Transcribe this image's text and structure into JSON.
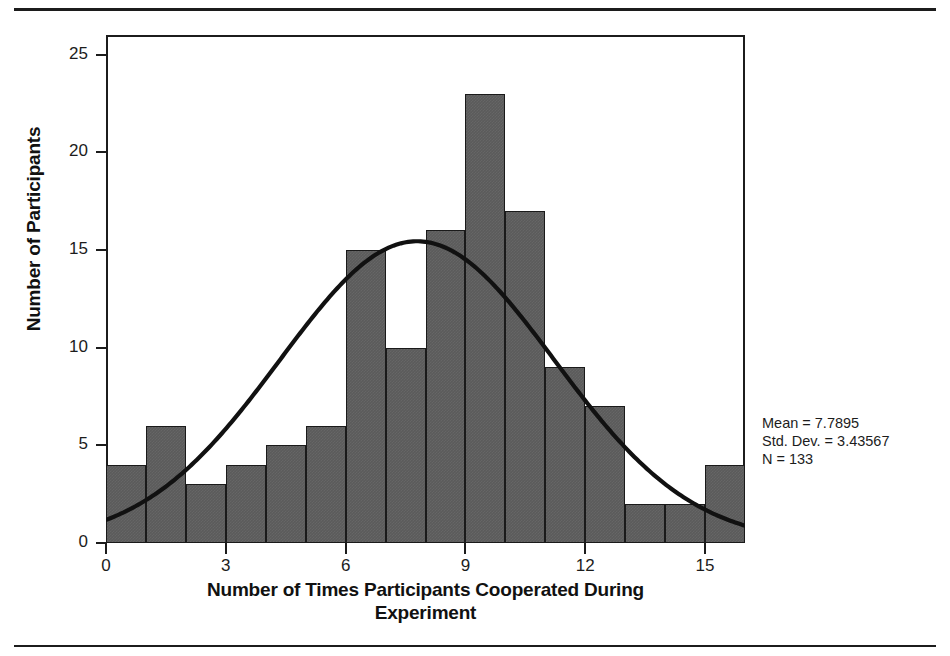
{
  "figure": {
    "kind": "histogram-with-normal-curve"
  },
  "rules": {
    "top": "horizontal-rule",
    "bottom": "horizontal-rule"
  },
  "stats": {
    "mean_line": "Mean = 7.7895",
    "std_dev_line": "Std. Dev. = 3.43567",
    "n_line": "N = 133"
  },
  "colors": {
    "bar_fill": "#5b5b5b",
    "bar_border": "#1a1a1a",
    "axis": "#1c1c1c",
    "curve": "#111111",
    "background": "#ffffff"
  },
  "chart_data": {
    "type": "bar",
    "title": "",
    "xlabel_line1": "Number of Times Participants Cooperated During",
    "xlabel_line2": "Experiment",
    "ylabel": "Number of Participants",
    "categories": [
      0,
      1,
      2,
      3,
      4,
      5,
      6,
      7,
      8,
      9,
      10,
      11,
      12,
      13,
      14,
      15,
      16
    ],
    "values": [
      4,
      6,
      3,
      4,
      5,
      6,
      15,
      10,
      16,
      23,
      17,
      9,
      7,
      2,
      2,
      4,
      0
    ],
    "bin_width": 1,
    "xlim": [
      0,
      16
    ],
    "ylim": [
      0,
      26
    ],
    "xticks": [
      0,
      3,
      6,
      9,
      12,
      15
    ],
    "yticks": [
      0,
      5,
      10,
      15,
      20,
      25
    ],
    "grid": false,
    "legend": "none",
    "overlay": {
      "type": "normal-curve",
      "mean": 7.7895,
      "std_dev": 3.43567,
      "n": 133,
      "scale_bin_width": 1
    },
    "annotations": [
      "Mean = 7.7895",
      "Std. Dev. = 3.43567",
      "N = 133"
    ]
  }
}
